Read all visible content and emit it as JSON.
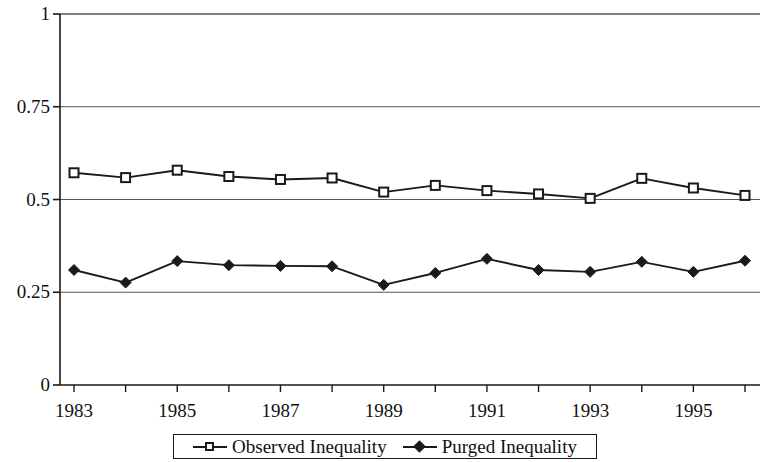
{
  "chart_data": {
    "type": "line",
    "title": "",
    "subtitle": "",
    "xlabel": "",
    "ylabel": "",
    "grid": true,
    "legend_position": "bottom",
    "xlim": [
      1983,
      1996
    ],
    "ylim": [
      0,
      1
    ],
    "yticks": [
      0,
      0.25,
      0.5,
      0.75,
      1
    ],
    "ytick_labels": [
      "0",
      "0.25",
      "0.5",
      "0.75",
      "1"
    ],
    "x": [
      1983,
      1984,
      1985,
      1986,
      1987,
      1988,
      1989,
      1990,
      1991,
      1992,
      1993,
      1994,
      1995,
      1996
    ],
    "xtick_labels": [
      "1983",
      "",
      "1985",
      "",
      "1987",
      "",
      "1989",
      "",
      "1991",
      "",
      "1993",
      "",
      "1995",
      ""
    ],
    "xtick_labels_shown": [
      "1983",
      "1985",
      "1987",
      "1989",
      "1991",
      "1993",
      "1995"
    ],
    "series": [
      {
        "name": "Observed Inequality",
        "marker": "square-open",
        "color": "#1a1a1a",
        "values": [
          0.572,
          0.559,
          0.579,
          0.562,
          0.554,
          0.558,
          0.52,
          0.538,
          0.524,
          0.515,
          0.503,
          0.557,
          0.531,
          0.511
        ]
      },
      {
        "name": "Purged Inequality",
        "marker": "diamond-filled",
        "color": "#1a1a1a",
        "values": [
          0.31,
          0.276,
          0.334,
          0.323,
          0.321,
          0.32,
          0.27,
          0.302,
          0.34,
          0.31,
          0.305,
          0.332,
          0.305,
          0.335
        ]
      }
    ]
  },
  "legend": {
    "entries": [
      {
        "label": "Observed Inequality",
        "marker": "square-open"
      },
      {
        "label": "Purged Inequality",
        "marker": "diamond-filled"
      }
    ]
  }
}
